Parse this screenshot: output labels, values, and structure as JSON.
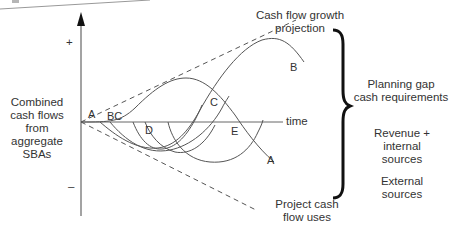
{
  "diagram": {
    "y_axis": {
      "plus_label": "+",
      "minus_label": "–"
    },
    "x_axis": {
      "label": "time"
    },
    "left_label": [
      "Combined",
      "cash flows",
      "from",
      "aggregate",
      "SBAs"
    ],
    "top_right_label": [
      "Cash flow growth",
      "projection"
    ],
    "bottom_label": [
      "Project cash",
      "flow uses"
    ],
    "bracket_labels": {
      "planning_gap": [
        "Planning gap",
        "cash requirements"
      ],
      "revenue": [
        "Revenue +",
        "internal",
        "sources"
      ],
      "external": [
        "External",
        "sources"
      ]
    },
    "curve_labels": {
      "A_start": "A",
      "BC": "BC",
      "B_end": "B",
      "C": "C",
      "D": "D",
      "E": "E",
      "A_end": "A"
    },
    "colors": {
      "line": "#555555",
      "text": "#333333",
      "bracket": "#111111"
    }
  }
}
